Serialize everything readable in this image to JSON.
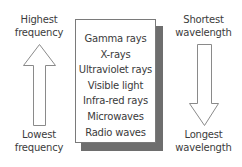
{
  "diagram": {
    "left_axis": {
      "top_label": [
        "Highest",
        "frequency"
      ],
      "bottom_label": [
        "Lowest",
        "frequency"
      ],
      "arrow_direction": "up"
    },
    "right_axis": {
      "top_label": [
        "Shortest",
        "wavelength"
      ],
      "bottom_label": [
        "Longest",
        "wavelength"
      ],
      "arrow_direction": "down"
    },
    "spectrum_items": [
      "Gamma rays",
      "X-rays",
      "Ultraviolet rays",
      "Visible light",
      "Infra-red rays",
      "Microwaves",
      "Radio waves"
    ],
    "colors": {
      "text": "#3a3a3a",
      "box_border": "#7a7a7a",
      "box_shadow": "#6e6e6e",
      "arrow_stroke": "#8a8a8a",
      "background": "#ffffff"
    }
  }
}
